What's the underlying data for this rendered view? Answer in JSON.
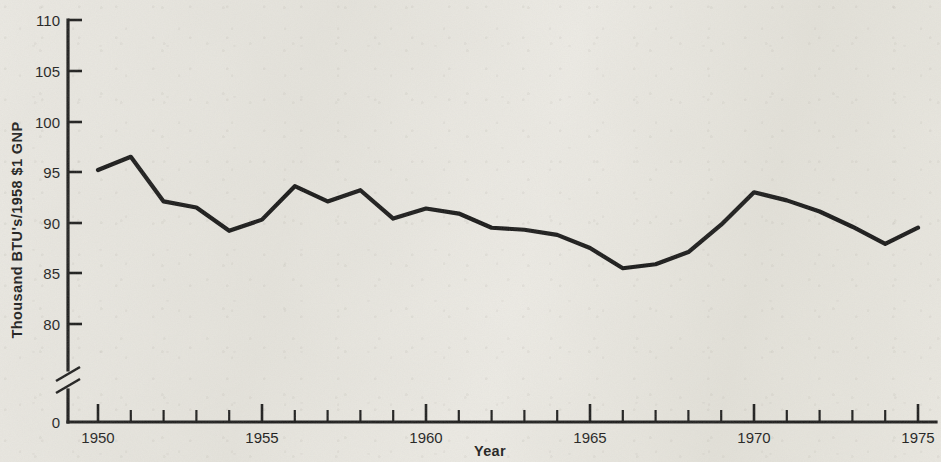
{
  "chart_data": {
    "type": "line",
    "title": "",
    "xlabel": "Year",
    "ylabel": "Thousand  BTU's/1958  $1 GNP",
    "xlim": [
      1949.5,
      1975.5
    ],
    "ylim": [
      77.5,
      110
    ],
    "grid": false,
    "legend": null,
    "y_axis_break": true,
    "y_axis_break_note": "axis broken between 0 and ~78",
    "xticks": [
      1950,
      1955,
      1960,
      1965,
      1970,
      1975
    ],
    "xtick_labels": [
      "1950",
      "1955",
      "1960",
      "1965",
      "1970",
      "1975"
    ],
    "x_minor_tick_interval": 1,
    "yticks": [
      0,
      80,
      85,
      90,
      95,
      100,
      105,
      110
    ],
    "ytick_labels": [
      "0",
      "80",
      "85",
      "90",
      "95",
      "100",
      "105",
      "110"
    ],
    "x": [
      1950,
      1951,
      1952,
      1953,
      1954,
      1955,
      1956,
      1957,
      1958,
      1959,
      1960,
      1961,
      1962,
      1963,
      1964,
      1965,
      1966,
      1967,
      1968,
      1969,
      1970,
      1971,
      1972,
      1973,
      1974,
      1975
    ],
    "values": [
      95.2,
      96.5,
      92.1,
      91.5,
      89.2,
      90.3,
      93.6,
      92.1,
      93.2,
      90.4,
      91.4,
      90.9,
      89.5,
      89.3,
      88.8,
      87.5,
      85.5,
      85.9,
      87.1,
      89.8,
      93.0,
      92.2,
      91.1,
      89.6,
      87.9,
      89.5
    ],
    "series": [
      {
        "name": "Energy consumption per dollar of GNP",
        "color": "#101010",
        "values": [
          95.2,
          96.5,
          92.1,
          91.5,
          89.2,
          90.3,
          93.6,
          92.1,
          93.2,
          90.4,
          91.4,
          90.9,
          89.5,
          89.3,
          88.8,
          87.5,
          85.5,
          85.9,
          87.1,
          89.8,
          93.0,
          92.2,
          91.1,
          89.6,
          87.9,
          89.5
        ]
      }
    ]
  }
}
